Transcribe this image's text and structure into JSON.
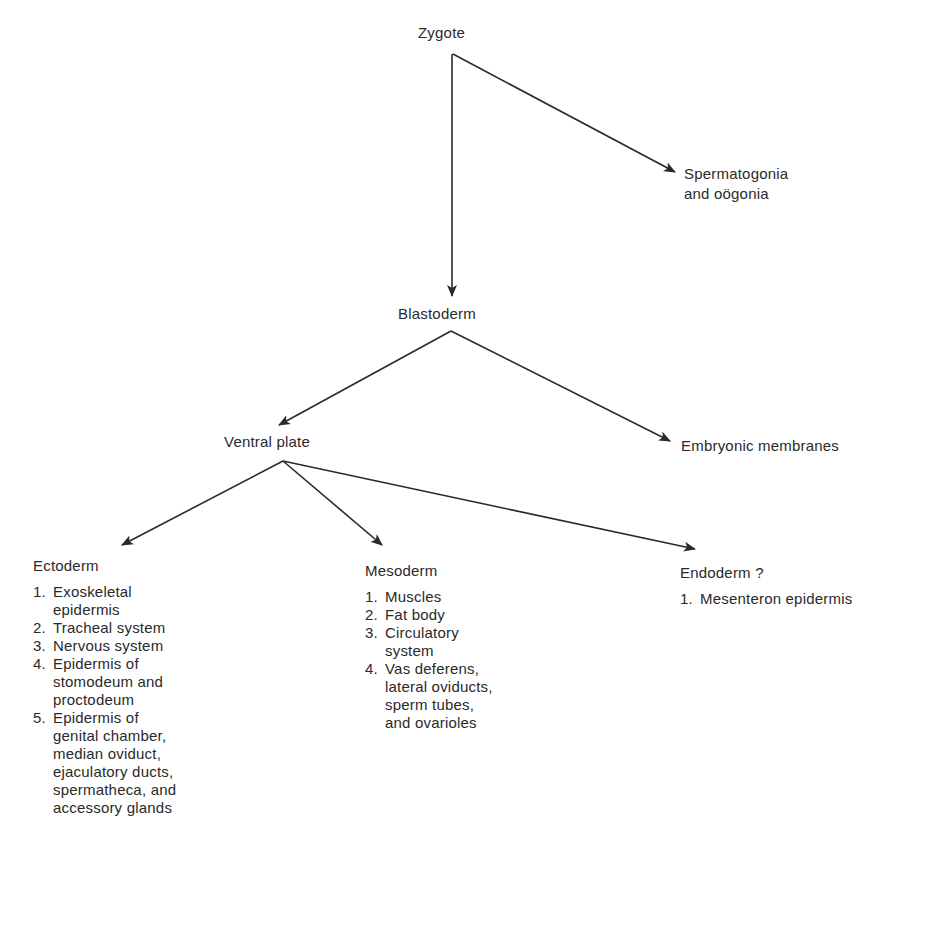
{
  "nodes": {
    "zygote": "Zygote",
    "germ_cells": "Spermatogonia\nand oögonia",
    "blastoderm": "Blastoderm",
    "ventral_plate": "Ventral plate",
    "embryonic_membranes": "Embryonic membranes"
  },
  "ectoderm": {
    "title": "Ectoderm",
    "items": [
      {
        "num": "1.",
        "text": "Exoskeletal\nepidermis"
      },
      {
        "num": "2.",
        "text": "Tracheal system"
      },
      {
        "num": "3.",
        "text": "Nervous system"
      },
      {
        "num": "4.",
        "text": "Epidermis of\nstomodeum and\nproctodeum"
      },
      {
        "num": "5.",
        "text": "Epidermis of\ngenital chamber,\nmedian oviduct,\nejaculatory ducts,\nspermatheca, and\naccessory glands"
      }
    ]
  },
  "mesoderm": {
    "title": "Mesoderm",
    "items": [
      {
        "num": "1.",
        "text": "Muscles"
      },
      {
        "num": "2.",
        "text": "Fat body"
      },
      {
        "num": "3.",
        "text": "Circulatory\nsystem"
      },
      {
        "num": "4.",
        "text": "Vas deferens,\nlateral oviducts,\nsperm tubes,\nand ovarioles"
      }
    ]
  },
  "endoderm": {
    "title": "Endoderm ?",
    "items": [
      {
        "num": "1.",
        "text": "Mesenteron epidermis"
      }
    ]
  },
  "edges": [
    {
      "from": "zygote",
      "to": "germ_cells"
    },
    {
      "from": "zygote",
      "to": "blastoderm"
    },
    {
      "from": "blastoderm",
      "to": "ventral_plate"
    },
    {
      "from": "blastoderm",
      "to": "embryonic_membranes"
    },
    {
      "from": "ventral_plate",
      "to": "ectoderm"
    },
    {
      "from": "ventral_plate",
      "to": "mesoderm"
    },
    {
      "from": "ventral_plate",
      "to": "endoderm"
    }
  ],
  "colors": {
    "line": "#2a2a2a",
    "text": "#2a2a2a",
    "background": "#ffffff"
  }
}
